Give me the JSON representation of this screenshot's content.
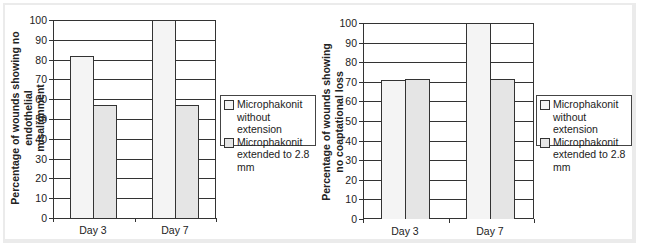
{
  "chart_data": [
    {
      "type": "bar",
      "title": "",
      "xlabel": "",
      "ylabel": "Percentage of wounds showing no endothelial misalignment",
      "ylabel_lines": [
        "Percentage of wounds showing no endothelial",
        "misalignment"
      ],
      "categories": [
        "Day 3",
        "Day 7"
      ],
      "series": [
        {
          "name": "Microphakonit without extension",
          "name_lines": [
            "Microphakonit",
            "without extension"
          ],
          "values": [
            82,
            100
          ],
          "color": "#f4f4f4"
        },
        {
          "name": "Microphakonit extended to 2.8 mm",
          "name_lines": [
            "Microphakonit",
            "extended to 2.8 mm"
          ],
          "values": [
            57,
            57
          ],
          "color": "#e5e5e5"
        }
      ],
      "yticks": [
        "100",
        "90",
        "80",
        "70",
        "60",
        "50",
        "40",
        "30",
        "20",
        "10",
        "0"
      ],
      "ylim": [
        0,
        100
      ],
      "grid": true,
      "legend_position": "right"
    },
    {
      "type": "bar",
      "title": "",
      "xlabel": "",
      "ylabel": "Percentage of wounds showing no coaptational loss",
      "ylabel_lines": [
        "Percentage of wounds showing",
        "no coaptational loss"
      ],
      "categories": [
        "Day 3",
        "Day 7"
      ],
      "series": [
        {
          "name": "Microphakonit without extension",
          "name_lines": [
            "Microphakonit",
            "without extension"
          ],
          "values": [
            71,
            100
          ],
          "color": "#f4f4f4"
        },
        {
          "name": "Microphakonit extended to 2.8 mm",
          "name_lines": [
            "Microphakonit",
            "extended to 2.8 mm"
          ],
          "values": [
            71.4,
            71.4
          ],
          "color": "#e5e5e5"
        }
      ],
      "yticks": [
        "100",
        "90",
        "80",
        "70",
        "60",
        "50",
        "40",
        "30",
        "20",
        "10",
        "0"
      ],
      "ylim": [
        0,
        100
      ],
      "grid": true,
      "legend_position": "right"
    }
  ]
}
